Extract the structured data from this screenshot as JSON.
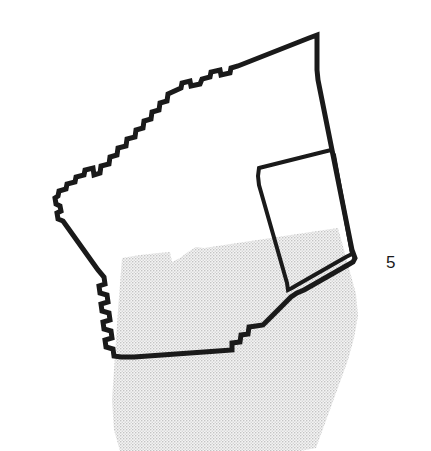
{
  "figure": {
    "width": 431,
    "height": 451,
    "background_color": "#ffffff"
  },
  "header": {
    "clipped_text": "ripped text baseline"
  },
  "labels": {
    "parcel_number": "5"
  },
  "colors": {
    "outline": "#1a1a1a",
    "overlay_fill": "#e9e9e9",
    "overlay_stipple_dot": "#b9b9b9",
    "inner_parcel_fill": "#ffffff",
    "page_background": "#ffffff",
    "label_text": "#1a1a1a"
  },
  "geometry": {
    "outline_stroke_width": 5,
    "inner_stroke_width": 4,
    "main_parcel_points": "317,35 309,38 238,66 231,68 230,73 221,75 220,70 211,72 210,77 202,79 200,84 191,86 190,81 182,83 181,88 168,94 167,101 160,103 159,110 152,112 151,119 144,121 143,128 136,130 135,137 127,139 126,146 118,148 117,155 110,157 109,164 101,166 100,173 94,175 93,168 85,170 84,175 76,177 75,182 67,184 66,189 59,191 58,196 55,198 56,204 60,206 61,211 57,213 58,219 63,221 68,228 73,235 78,242 83,249 88,256 93,263 98,270 104,277 105,284 99,286 100,293 107,295 108,302 101,304 102,311 109,313 110,320 103,322 104,329 111,331 112,338 105,340 106,347 113,349 114,356 121,357 134,357 148,356 162,355 176,354 190,353 204,352 218,351 232,350 232,343 240,342 241,335 248,334 249,327 256,326 263,325 270,318 277,311 284,304 291,297 297,293 304,290 311,286 318,282 325,278 332,274 339,270 346,266 353,262 355,258 352,250 350,240 348,230 346,220 344,210 342,200 340,190 338,180 336,170 334,160 332,150 330,140 328,130 326,120 324,110 322,100 320,90 318,80 317,70",
    "inner_parcel_points": "259,168 267,166 275,164 283,162 291,160 299,158 307,156 315,154 323,152 331,150 334,155 336,166 338,177 340,188 342,199 344,210 346,221 348,232 350,243 352,254 346,257 339,261 332,265 325,269 318,273 311,277 304,281 297,285 292,288 288,290 287,283 285,276 283,269 281,262 279,255 277,248 275,241 273,234 271,227 269,220 267,213 265,206 263,199 261,192 259,185 258,176",
    "overlay_points": "122,258 140,255 158,253 170,252 172,262 180,258 188,252 196,247 204,248 224,245 244,242 264,239 284,236 304,233 324,230 338,228 344,250 350,272 356,294 358,316 354,338 348,360 340,382 332,404 324,426 316,448 300,451 260,451 220,451 180,451 140,451 120,451 114,430 112,400 114,370 116,340 118,310 120,284"
  },
  "legend": {
    "overlay_description": "stippled overlay region",
    "outline_description": "parcel boundary outline",
    "inner_description": "inner sub-parcel"
  }
}
